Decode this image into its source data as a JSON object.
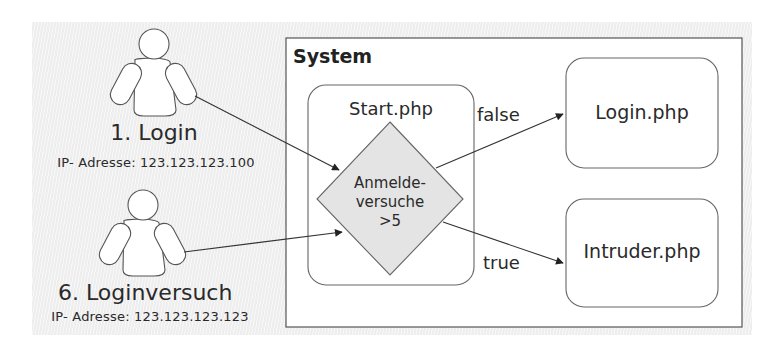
{
  "actors": [
    {
      "name": "1. Login",
      "ip": "IP- Adresse: 123.123.123.100"
    },
    {
      "name": "6. Loginversuch",
      "ip": "IP- Adresse: 123.123.123.123"
    }
  ],
  "system": {
    "title": "System",
    "start_node": {
      "label": "Start.php"
    },
    "decision": {
      "line1": "Anmelde-",
      "line2": "versuche",
      "line3": ">5"
    },
    "login_node": {
      "label": "Login.php"
    },
    "intruder_node": {
      "label": "Intruder.php"
    }
  },
  "edges": {
    "false_label": "false",
    "true_label": "true"
  },
  "colors": {
    "background": "#eeeeee",
    "stroke": "#555555",
    "decision_fill": "#e4e4e4",
    "box_fill": "#ffffff"
  }
}
